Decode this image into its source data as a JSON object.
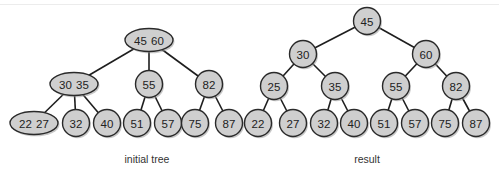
{
  "diagrams": [
    {
      "id": "initial",
      "caption": "initial tree",
      "caption_pos": [
        147,
        163
      ],
      "nodes": [
        {
          "id": "a",
          "keys": [
            "45",
            "60"
          ],
          "x": 149,
          "y": 40,
          "shape": "ellipse"
        },
        {
          "id": "b",
          "keys": [
            "30",
            "35"
          ],
          "x": 74,
          "y": 84,
          "shape": "ellipse"
        },
        {
          "id": "c",
          "keys": [
            "55"
          ],
          "x": 149,
          "y": 84,
          "shape": "circle"
        },
        {
          "id": "d",
          "keys": [
            "82"
          ],
          "x": 209,
          "y": 84,
          "shape": "circle"
        },
        {
          "id": "e",
          "keys": [
            "22",
            "27"
          ],
          "x": 34,
          "y": 123,
          "shape": "ellipse"
        },
        {
          "id": "f",
          "keys": [
            "32"
          ],
          "x": 76,
          "y": 123,
          "shape": "circle"
        },
        {
          "id": "g",
          "keys": [
            "40"
          ],
          "x": 107,
          "y": 123,
          "shape": "circle"
        },
        {
          "id": "h",
          "keys": [
            "51"
          ],
          "x": 137,
          "y": 123,
          "shape": "circle"
        },
        {
          "id": "i",
          "keys": [
            "57"
          ],
          "x": 168,
          "y": 123,
          "shape": "circle"
        },
        {
          "id": "j",
          "keys": [
            "75"
          ],
          "x": 195,
          "y": 123,
          "shape": "circle"
        },
        {
          "id": "k",
          "keys": [
            "87"
          ],
          "x": 229,
          "y": 123,
          "shape": "circle"
        }
      ],
      "edges": [
        [
          "a",
          "b"
        ],
        [
          "a",
          "c"
        ],
        [
          "a",
          "d"
        ],
        [
          "b",
          "e"
        ],
        [
          "b",
          "f"
        ],
        [
          "b",
          "g"
        ],
        [
          "c",
          "h"
        ],
        [
          "c",
          "i"
        ],
        [
          "d",
          "j"
        ],
        [
          "d",
          "k"
        ]
      ]
    },
    {
      "id": "result",
      "caption": "result",
      "caption_pos": [
        367,
        163
      ],
      "nodes": [
        {
          "id": "r45",
          "keys": [
            "45"
          ],
          "x": 367,
          "y": 21,
          "shape": "circle"
        },
        {
          "id": "r30",
          "keys": [
            "30"
          ],
          "x": 303,
          "y": 54,
          "shape": "circle"
        },
        {
          "id": "r60",
          "keys": [
            "60"
          ],
          "x": 426,
          "y": 54,
          "shape": "circle"
        },
        {
          "id": "r25",
          "keys": [
            "25"
          ],
          "x": 274,
          "y": 86,
          "shape": "circle"
        },
        {
          "id": "r35",
          "keys": [
            "35"
          ],
          "x": 335,
          "y": 86,
          "shape": "circle"
        },
        {
          "id": "r55",
          "keys": [
            "55"
          ],
          "x": 396,
          "y": 86,
          "shape": "circle"
        },
        {
          "id": "r82",
          "keys": [
            "82"
          ],
          "x": 456,
          "y": 86,
          "shape": "circle"
        },
        {
          "id": "r22",
          "keys": [
            "22"
          ],
          "x": 258,
          "y": 123,
          "shape": "circle"
        },
        {
          "id": "r27",
          "keys": [
            "27"
          ],
          "x": 293,
          "y": 123,
          "shape": "circle"
        },
        {
          "id": "r32",
          "keys": [
            "32"
          ],
          "x": 324,
          "y": 123,
          "shape": "circle"
        },
        {
          "id": "r40",
          "keys": [
            "40"
          ],
          "x": 354,
          "y": 123,
          "shape": "circle"
        },
        {
          "id": "r51",
          "keys": [
            "51"
          ],
          "x": 384,
          "y": 123,
          "shape": "circle"
        },
        {
          "id": "r57",
          "keys": [
            "57"
          ],
          "x": 415,
          "y": 123,
          "shape": "circle"
        },
        {
          "id": "r75",
          "keys": [
            "75"
          ],
          "x": 445,
          "y": 123,
          "shape": "circle"
        },
        {
          "id": "r87",
          "keys": [
            "87"
          ],
          "x": 476,
          "y": 123,
          "shape": "circle"
        }
      ],
      "edges": [
        [
          "r45",
          "r30"
        ],
        [
          "r45",
          "r60"
        ],
        [
          "r30",
          "r25"
        ],
        [
          "r30",
          "r35"
        ],
        [
          "r60",
          "r55"
        ],
        [
          "r60",
          "r82"
        ],
        [
          "r25",
          "r22"
        ],
        [
          "r25",
          "r27"
        ],
        [
          "r35",
          "r32"
        ],
        [
          "r35",
          "r40"
        ],
        [
          "r55",
          "r51"
        ],
        [
          "r55",
          "r57"
        ],
        [
          "r82",
          "r75"
        ],
        [
          "r82",
          "r87"
        ]
      ]
    }
  ],
  "colors": {
    "node_fill": "#cfcfcf",
    "node_stroke": "#2a2a2a",
    "edge": "#1e1e1e",
    "text": "#222222"
  }
}
